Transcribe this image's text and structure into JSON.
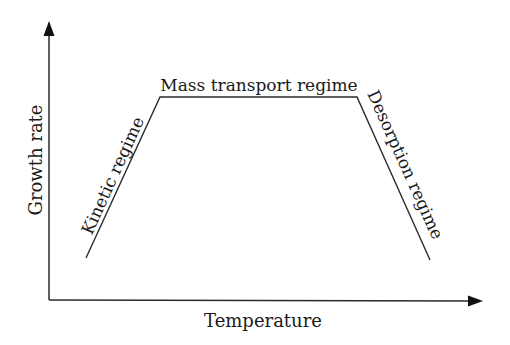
{
  "diagram": {
    "x_axis_label": "Temperature",
    "y_axis_label": "Growth rate",
    "regimes": [
      {
        "label": "Kinetic regime"
      },
      {
        "label": "Mass transport regime"
      },
      {
        "label": "Desorption regime"
      }
    ],
    "colors": {
      "line": "#2a2a2a",
      "text": "#1a1a1a"
    }
  }
}
